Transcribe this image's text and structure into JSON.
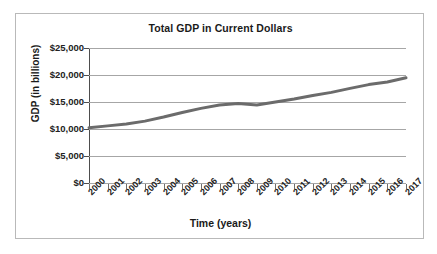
{
  "chart_data": {
    "type": "line",
    "title": "Total GDP in Current Dollars",
    "xlabel": "Time (years)",
    "ylabel": "GDP (in billions)",
    "x": [
      2000,
      2001,
      2002,
      2003,
      2004,
      2005,
      2006,
      2007,
      2008,
      2009,
      2010,
      2011,
      2012,
      2013,
      2014,
      2015,
      2016,
      2017
    ],
    "categories": [
      "2000",
      "2001",
      "2002",
      "2003",
      "2004",
      "2005",
      "2006",
      "2007",
      "2008",
      "2009",
      "2010",
      "2011",
      "2012",
      "2013",
      "2014",
      "2015",
      "2016",
      "2017"
    ],
    "series": [
      {
        "name": "Total GDP",
        "values": [
          10250,
          10580,
          10940,
          11460,
          12210,
          13040,
          13820,
          14450,
          14710,
          14450,
          14990,
          15540,
          16200,
          16780,
          17520,
          18220,
          18710,
          19490
        ],
        "color": "#6b6b6b"
      }
    ],
    "ytick_labels": [
      "$25,000",
      "$20,000",
      "$15,000",
      "$10,000",
      "$5,000",
      "$0"
    ],
    "ytick_values": [
      25000,
      20000,
      15000,
      10000,
      5000,
      0
    ],
    "ylim": [
      0,
      25000
    ],
    "xlim": [
      2000,
      2017
    ],
    "grid": true,
    "grid_axis": "y",
    "grid_color": "#a6a6a6",
    "legend": false,
    "legend_position": "none",
    "plot_background": "#ffffff",
    "frame_border_color": "#b9b9b9",
    "axis_color": "#4d4d4d",
    "line_width": 3
  }
}
